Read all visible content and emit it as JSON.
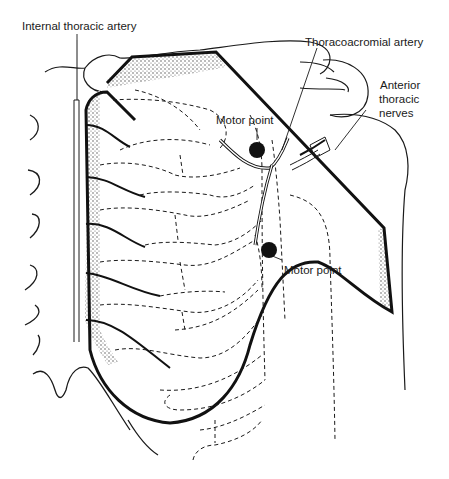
{
  "figure": {
    "labels": {
      "internal_thoracic_artery": "Internal thoracic artery",
      "thoracoacromial_artery": "Thoracoacromial artery",
      "anterior_thoracic_nerves_line1": "Anterior",
      "anterior_thoracic_nerves_line2": "thoracic",
      "anterior_thoracic_nerves_line3": "nerves",
      "motor_point_upper": "Motor point",
      "motor_point_lower": "Motor point"
    },
    "colors": {
      "ink": "#1a1a1a",
      "background": "#ffffff",
      "stipple": "#555555"
    }
  }
}
